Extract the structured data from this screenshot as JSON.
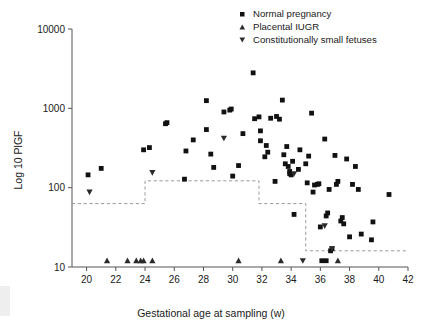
{
  "figure": {
    "background": "#ffffff",
    "marker_color": "#111111",
    "refline_color": "#9a9a9a"
  },
  "axes": {
    "x_title": "Gestational age at sampling (w)",
    "y_title": "Log 10 PlGF",
    "x_ticks": [
      20,
      22,
      24,
      26,
      28,
      30,
      32,
      34,
      36,
      38,
      40,
      42
    ],
    "y_ticks": [
      10,
      100,
      1000,
      10000
    ],
    "y_tick_labels": [
      "10",
      "100",
      "1000",
      "10000"
    ],
    "x_tick_labels": [
      "20",
      "22",
      "24",
      "26",
      "28",
      "30",
      "32",
      "34",
      "36",
      "38",
      "40",
      "42"
    ]
  },
  "legend": {
    "position": "top-right",
    "items": [
      {
        "label": "Normal pregnancy",
        "marker": "square",
        "icon": "square-marker-icon"
      },
      {
        "label": "Placental IUGR",
        "marker": "triangle-up",
        "icon": "triangle-up-marker-icon"
      },
      {
        "label": "Constitutionally small fetuses",
        "marker": "triangle-down",
        "icon": "triangle-down-marker-icon"
      }
    ]
  },
  "chart_data": {
    "type": "scatter",
    "title": "",
    "xlabel": "Gestational age at sampling (w)",
    "ylabel": "Log 10 PlGF",
    "xlim": [
      19,
      42
    ],
    "ylim": [
      10,
      10000
    ],
    "yscale": "log",
    "grid": false,
    "legend_position": "top-right",
    "series": [
      {
        "name": "Normal pregnancy",
        "marker": "square",
        "color": "#111111",
        "points": [
          [
            20.1,
            145
          ],
          [
            21.0,
            175
          ],
          [
            23.9,
            300
          ],
          [
            24.3,
            320
          ],
          [
            25.4,
            640
          ],
          [
            25.5,
            660
          ],
          [
            26.7,
            128
          ],
          [
            26.8,
            290
          ],
          [
            27.3,
            400
          ],
          [
            28.2,
            1250
          ],
          [
            28.2,
            540
          ],
          [
            28.5,
            265
          ],
          [
            28.7,
            180
          ],
          [
            29.4,
            900
          ],
          [
            29.8,
            950
          ],
          [
            29.9,
            980
          ],
          [
            30.0,
            140
          ],
          [
            30.4,
            190
          ],
          [
            30.7,
            480
          ],
          [
            31.4,
            2800
          ],
          [
            31.5,
            740
          ],
          [
            31.8,
            780
          ],
          [
            31.9,
            520
          ],
          [
            31.9,
            390
          ],
          [
            32.2,
            245
          ],
          [
            32.3,
            340
          ],
          [
            32.4,
            280
          ],
          [
            32.6,
            750
          ],
          [
            32.9,
            120
          ],
          [
            33.0,
            790
          ],
          [
            33.2,
            730
          ],
          [
            33.4,
            1270
          ],
          [
            33.5,
            260
          ],
          [
            33.6,
            200
          ],
          [
            33.7,
            330
          ],
          [
            33.8,
            185
          ],
          [
            33.9,
            160
          ],
          [
            33.9,
            150
          ],
          [
            34.0,
            145
          ],
          [
            34.1,
            215
          ],
          [
            34.2,
            46
          ],
          [
            34.5,
            170
          ],
          [
            34.6,
            300
          ],
          [
            35.0,
            200
          ],
          [
            35.1,
            115
          ],
          [
            35.2,
            250
          ],
          [
            35.4,
            870
          ],
          [
            35.5,
            88
          ],
          [
            35.6,
            108
          ],
          [
            35.8,
            110
          ],
          [
            35.9,
            112
          ],
          [
            36.0,
            32
          ],
          [
            36.1,
            12
          ],
          [
            36.3,
            410
          ],
          [
            36.4,
            12
          ],
          [
            36.4,
            44
          ],
          [
            36.5,
            48
          ],
          [
            36.6,
            95
          ],
          [
            36.7,
            16
          ],
          [
            36.8,
            17
          ],
          [
            37.0,
            255
          ],
          [
            37.1,
            110
          ],
          [
            37.2,
            120
          ],
          [
            37.4,
            38
          ],
          [
            37.5,
            42
          ],
          [
            37.6,
            35
          ],
          [
            37.8,
            230
          ],
          [
            38.0,
            24
          ],
          [
            38.2,
            110
          ],
          [
            38.4,
            185
          ],
          [
            38.6,
            95
          ],
          [
            38.8,
            26
          ],
          [
            39.5,
            22
          ],
          [
            39.6,
            37
          ],
          [
            40.7,
            82
          ]
        ]
      },
      {
        "name": "Placental IUGR",
        "marker": "triangle-up",
        "color": "#2b2b2b",
        "points": [
          [
            21.4,
            12
          ],
          [
            22.8,
            12
          ],
          [
            23.4,
            12
          ],
          [
            23.7,
            12
          ],
          [
            23.9,
            12
          ],
          [
            24.5,
            12
          ],
          [
            30.4,
            12
          ],
          [
            33.3,
            12
          ],
          [
            37.2,
            12
          ]
        ]
      },
      {
        "name": "Constitutionally small fetuses",
        "marker": "triangle-down",
        "color": "#2b2b2b",
        "points": [
          [
            20.2,
            88
          ],
          [
            24.5,
            155
          ],
          [
            29.4,
            420
          ],
          [
            34.2,
            150
          ],
          [
            34.8,
            12
          ],
          [
            36.3,
            33
          ],
          [
            36.8,
            17
          ]
        ]
      }
    ],
    "reference_line": {
      "style": "dashed",
      "color": "#9a9a9a",
      "description": "step function of lower reference limit",
      "steps": [
        {
          "x_start": 19.0,
          "x_end": 24.0,
          "y": 63
        },
        {
          "x_start": 24.0,
          "x_end": 31.8,
          "y": 122
        },
        {
          "x_start": 31.8,
          "x_end": 35.0,
          "y": 63
        },
        {
          "x_start": 35.0,
          "x_end": 42.0,
          "y": 16
        }
      ]
    }
  }
}
